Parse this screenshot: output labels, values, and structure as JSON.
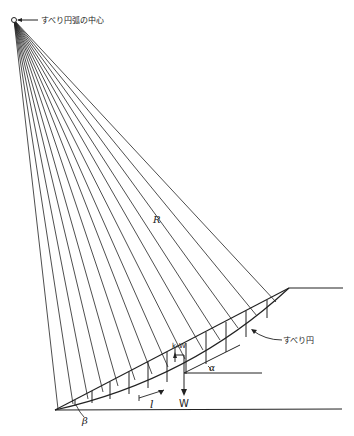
{
  "diagram": {
    "labels": {
      "center": "すべり円弧の中心",
      "radius": "R",
      "slip_circle": "すべり円",
      "seismic_force": "kₕW",
      "weight": "W",
      "slice_length": "l",
      "alpha": "α",
      "beta": "β"
    },
    "colors": {
      "line": "#222222",
      "background": "#ffffff"
    },
    "geometry": {
      "center": [
        14,
        20
      ],
      "slope_toe": [
        55,
        410
      ],
      "slope_crest": [
        289,
        288
      ],
      "crest_flat_end": [
        343,
        288
      ],
      "ground_end": [
        342,
        409
      ],
      "radial_line_count": 14
    }
  }
}
